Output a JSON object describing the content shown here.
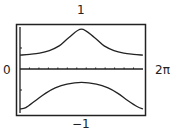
{
  "labels": {
    "top": "1",
    "bottom": "−1",
    "left": "0",
    "right": "2π"
  },
  "chart_data": {
    "type": "line",
    "title": "",
    "xlabel": "",
    "ylabel": "",
    "xlim": [
      0,
      6.2832
    ],
    "ylim": [
      -1,
      1
    ],
    "x_tick_labels": [
      "0",
      "2π"
    ],
    "y_tick_labels": [
      "1",
      "-1"
    ],
    "grid": false,
    "legend": null,
    "series": [
      {
        "name": "upper branch",
        "x": [
          0.0,
          0.5,
          1.0,
          1.5,
          2.0,
          2.5,
          3.14,
          3.8,
          4.3,
          4.8,
          5.3,
          5.8,
          6.28
        ],
        "y": [
          0.33,
          0.35,
          0.38,
          0.44,
          0.55,
          0.75,
          0.95,
          0.75,
          0.55,
          0.44,
          0.38,
          0.35,
          0.33
        ]
      },
      {
        "name": "lower branch",
        "x": [
          0.0,
          0.3,
          0.8,
          1.3,
          1.8,
          2.4,
          3.14,
          3.9,
          4.5,
          5.0,
          5.5,
          6.0,
          6.28
        ],
        "y": [
          -0.95,
          -0.92,
          -0.75,
          -0.58,
          -0.45,
          -0.36,
          -0.32,
          -0.36,
          -0.45,
          -0.58,
          -0.75,
          -0.9,
          -0.95
        ]
      }
    ],
    "x_minor_ticks": 13
  }
}
